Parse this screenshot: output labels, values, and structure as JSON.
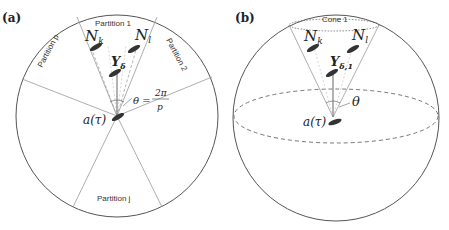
{
  "panel_a": {
    "label": "(a)",
    "partitions": [
      "Partition 1",
      "Partition 2",
      "Partition p",
      "Partition j"
    ],
    "nodes": {
      "nk": "N",
      "nk_sub": "k",
      "nl": "N",
      "nl_sub": "l",
      "y": "Y",
      "y_sub": "δ"
    },
    "origin": "a(τ)",
    "theta_eq": "θ =",
    "theta_num": "2π",
    "theta_den": "p"
  },
  "panel_b": {
    "label": "(b)",
    "cone": "Cone 1",
    "nodes": {
      "nk": "N",
      "nk_sub": "k",
      "nl": "N",
      "nl_sub": "l",
      "y": "Y",
      "y_sub": "δ,1"
    },
    "origin": "a(τ)",
    "theta": "θ"
  },
  "colors": {
    "outline": "#555555",
    "line": "#888888",
    "dashed": "#777777",
    "drone": "#333333"
  }
}
